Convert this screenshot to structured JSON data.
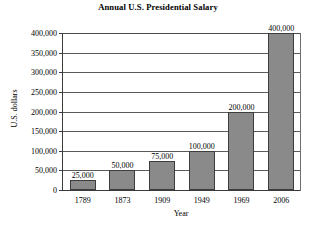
{
  "chart_data": {
    "type": "bar",
    "title": "Annual U.S. Presidential Salary",
    "xlabel": "Year",
    "ylabel": "U.S. dollars",
    "categories": [
      "1789",
      "1873",
      "1909",
      "1949",
      "1969",
      "2006"
    ],
    "values": [
      25000,
      50000,
      75000,
      100000,
      200000,
      400000
    ],
    "value_labels": [
      "25,000",
      "50,000",
      "75,000",
      "100,000",
      "200,000",
      "400,000"
    ],
    "ylim": [
      0,
      400000
    ],
    "ytick_values": [
      0,
      50000,
      100000,
      150000,
      200000,
      250000,
      300000,
      350000,
      400000
    ],
    "ytick_labels": [
      "0",
      "50,000",
      "100,000",
      "150,000",
      "200,000",
      "250,000",
      "300,000",
      "350,000",
      "400,000"
    ],
    "grid": true,
    "legend": "none",
    "bar_color": "#8a8a8a",
    "bar_border_color": "#3d3d3d",
    "gridline_color": "#5a5a5a",
    "axis_color": "#3b3b3b",
    "background_color": "#ffffff"
  }
}
